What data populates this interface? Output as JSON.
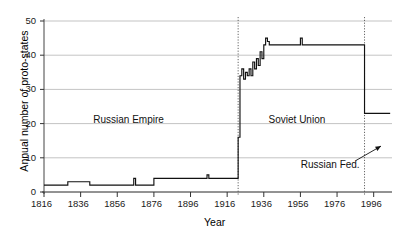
{
  "chart_data": {
    "type": "line",
    "title": "",
    "xlabel": "Year",
    "ylabel": "Annual number of proto-states",
    "xlim": [
      1816,
      2006
    ],
    "ylim": [
      0,
      50
    ],
    "xticks": [
      1816,
      1836,
      1856,
      1876,
      1896,
      1916,
      1936,
      1956,
      1976,
      1996
    ],
    "yticks": [
      0,
      10,
      20,
      30,
      40,
      50
    ],
    "grid": "horizontal",
    "legend": "none",
    "line_color": "#111111",
    "grid_color": "#aaaaaa",
    "series": [
      {
        "name": "Annual number of proto-states",
        "x": [
          1816,
          1817,
          1818,
          1819,
          1820,
          1821,
          1822,
          1823,
          1824,
          1825,
          1826,
          1827,
          1828,
          1829,
          1830,
          1831,
          1832,
          1833,
          1834,
          1835,
          1836,
          1837,
          1838,
          1839,
          1840,
          1841,
          1842,
          1843,
          1844,
          1845,
          1846,
          1847,
          1848,
          1849,
          1850,
          1851,
          1852,
          1853,
          1854,
          1855,
          1856,
          1857,
          1858,
          1859,
          1860,
          1861,
          1862,
          1863,
          1864,
          1865,
          1866,
          1867,
          1868,
          1869,
          1870,
          1871,
          1872,
          1873,
          1874,
          1875,
          1876,
          1877,
          1878,
          1879,
          1880,
          1881,
          1882,
          1883,
          1884,
          1885,
          1886,
          1887,
          1888,
          1889,
          1890,
          1891,
          1892,
          1893,
          1894,
          1895,
          1896,
          1897,
          1898,
          1899,
          1900,
          1901,
          1902,
          1903,
          1904,
          1905,
          1906,
          1907,
          1908,
          1909,
          1910,
          1911,
          1912,
          1913,
          1914,
          1915,
          1916,
          1917,
          1918,
          1919,
          1920,
          1921,
          1922,
          1923,
          1924,
          1925,
          1926,
          1927,
          1928,
          1929,
          1930,
          1931,
          1932,
          1933,
          1934,
          1935,
          1936,
          1937,
          1938,
          1939,
          1940,
          1941,
          1942,
          1943,
          1944,
          1945,
          1946,
          1947,
          1948,
          1949,
          1950,
          1951,
          1952,
          1953,
          1954,
          1955,
          1956,
          1957,
          1958,
          1959,
          1960,
          1961,
          1962,
          1963,
          1964,
          1965,
          1966,
          1967,
          1968,
          1969,
          1970,
          1971,
          1972,
          1973,
          1974,
          1975,
          1976,
          1977,
          1978,
          1979,
          1980,
          1981,
          1982,
          1983,
          1984,
          1985,
          1986,
          1987,
          1988,
          1989,
          1990,
          1991,
          1992,
          1993,
          1994,
          1995,
          1996,
          1997,
          1998,
          1999,
          2000,
          2001,
          2002,
          2003,
          2004,
          2005
        ],
        "y": [
          2,
          2,
          2,
          2,
          2,
          2,
          2,
          2,
          2,
          2,
          2,
          2,
          2,
          3,
          3,
          3,
          3,
          3,
          3,
          3,
          3,
          3,
          3,
          3,
          3,
          2,
          2,
          2,
          2,
          2,
          2,
          2,
          2,
          2,
          2,
          2,
          2,
          2,
          2,
          2,
          2,
          2,
          2,
          2,
          2,
          2,
          2,
          2,
          2,
          4,
          2,
          2,
          2,
          2,
          2,
          2,
          2,
          2,
          2,
          2,
          4,
          4,
          4,
          4,
          4,
          4,
          4,
          4,
          4,
          4,
          4,
          4,
          4,
          4,
          4,
          4,
          4,
          4,
          4,
          4,
          4,
          4,
          4,
          4,
          4,
          4,
          4,
          4,
          4,
          5,
          4,
          4,
          4,
          4,
          4,
          4,
          4,
          4,
          4,
          4,
          4,
          4,
          4,
          4,
          4,
          4,
          16,
          34,
          36,
          33,
          35,
          34,
          36,
          34,
          38,
          36,
          39,
          37,
          41,
          39,
          43,
          45,
          44,
          43,
          43,
          43,
          43,
          43,
          43,
          43,
          43,
          43,
          43,
          43,
          43,
          43,
          43,
          43,
          43,
          43,
          45,
          43,
          43,
          43,
          43,
          43,
          43,
          43,
          43,
          43,
          43,
          43,
          43,
          43,
          43,
          43,
          43,
          43,
          43,
          43,
          43,
          43,
          43,
          43,
          43,
          43,
          43,
          43,
          43,
          43,
          43,
          43,
          43,
          43,
          43,
          23,
          23,
          23,
          23,
          23,
          23,
          23,
          23,
          23,
          23,
          23,
          23,
          23,
          23,
          23
        ]
      }
    ],
    "vertical_markers": [
      {
        "x": 1922,
        "style": "dotted",
        "label": ""
      },
      {
        "x": 1991,
        "style": "dotted",
        "label": ""
      }
    ],
    "annotations": [
      {
        "name": "russian-empire",
        "text": "Russian Empire",
        "x": 1862,
        "y": 21
      },
      {
        "name": "soviet-union",
        "text": "Soviet Union",
        "x": 1955,
        "y": 21
      },
      {
        "name": "russian-fed",
        "text": "Russian Fed.",
        "x": 1972,
        "y": 8,
        "arrow_to_x": 2000,
        "arrow_to_y": 14
      }
    ]
  },
  "ticklabels": {
    "x": [
      "1816",
      "1836",
      "1856",
      "1876",
      "1896",
      "1916",
      "1936",
      "1956",
      "1976",
      "1996"
    ],
    "y": [
      "0",
      "10",
      "20",
      "30",
      "40",
      "50"
    ]
  },
  "labels": {
    "xaxis": "Year",
    "yaxis": "Annual number of proto-states"
  },
  "annotation_text": {
    "russian_empire": "Russian Empire",
    "soviet_union": "Soviet Union",
    "russian_fed": "Russian Fed."
  }
}
